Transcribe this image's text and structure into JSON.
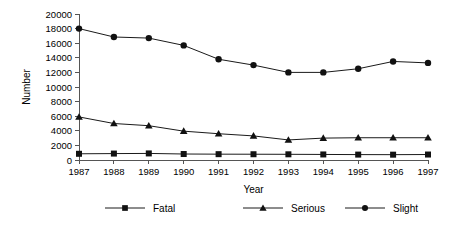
{
  "chart_data": {
    "type": "line",
    "title": "",
    "xlabel": "Year",
    "ylabel": "Number",
    "categories": [
      "1987",
      "1988",
      "1989",
      "1990",
      "1991",
      "1992",
      "1993",
      "1994",
      "1995",
      "1996",
      "1997"
    ],
    "x": [
      1987,
      1988,
      1989,
      1990,
      1991,
      1992,
      1993,
      1994,
      1995,
      1996,
      1997
    ],
    "xlim": [
      1987,
      1997
    ],
    "ylim": [
      0,
      20000
    ],
    "ytick_labels": [
      "0",
      "2000",
      "4000",
      "6000",
      "8000",
      "10000",
      "12000",
      "14000",
      "16000",
      "18000",
      "20000"
    ],
    "yticks": [
      0,
      2000,
      4000,
      6000,
      8000,
      10000,
      12000,
      14000,
      16000,
      18000,
      20000
    ],
    "grid": false,
    "legend_position": "bottom",
    "series": [
      {
        "name": "Fatal",
        "marker": "square",
        "values": [
          850,
          880,
          900,
          820,
          800,
          790,
          780,
          760,
          740,
          730,
          750
        ]
      },
      {
        "name": "Serious",
        "marker": "triangle",
        "values": [
          5900,
          5000,
          4700,
          3950,
          3600,
          3300,
          2750,
          3000,
          3050,
          3050,
          3050
        ]
      },
      {
        "name": "Slight",
        "marker": "circle",
        "values": [
          18000,
          16850,
          16700,
          15700,
          13800,
          13000,
          12000,
          12000,
          12500,
          13500,
          13300
        ]
      }
    ]
  },
  "legend": {
    "items": [
      {
        "label": "Fatal",
        "marker": "square"
      },
      {
        "label": "Serious",
        "marker": "triangle"
      },
      {
        "label": "Slight",
        "marker": "circle"
      }
    ]
  },
  "colors": {
    "series": "#111111",
    "axis": "#555555",
    "background": "#ffffff"
  }
}
